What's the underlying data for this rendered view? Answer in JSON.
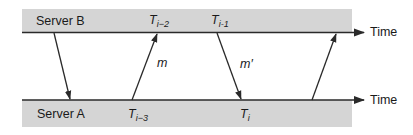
{
  "diagram": {
    "type": "message-exchange timing diagram",
    "servers": {
      "top": {
        "label": "Server B"
      },
      "bottom": {
        "label": "Server A"
      }
    },
    "axis_label": "Time",
    "timestamps": {
      "t_i_minus_2": {
        "base": "T",
        "sub": "i−2",
        "server": "Server B"
      },
      "t_i_minus_1": {
        "base": "T",
        "sub": "i-1",
        "server": "Server B"
      },
      "t_i_minus_3": {
        "base": "T",
        "sub": "i−3",
        "server": "Server A"
      },
      "t_i": {
        "base": "T",
        "sub": "i",
        "server": "Server A"
      }
    },
    "messages": [
      {
        "label": "",
        "from": "Server B",
        "to": "Server A"
      },
      {
        "label": "m",
        "from": "Server A",
        "to": "Server B"
      },
      {
        "label": "m′",
        "from": "Server B",
        "to": "Server A"
      },
      {
        "label": "",
        "from": "Server A",
        "to": "Server B"
      }
    ],
    "colors": {
      "band": "#d5d5d5",
      "line": "#2a2a2a",
      "text": "#1a1a1a"
    }
  }
}
